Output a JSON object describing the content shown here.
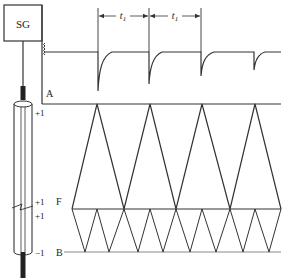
{
  "diagram": {
    "generator_label": "SG",
    "period_label": "t",
    "period_subscript": "1",
    "labels": {
      "A": "A",
      "F": "F",
      "B": "B",
      "plus_one_top": "+1",
      "plus_one_f_upper": "+1",
      "plus_one_f_lower": "+1",
      "minus_one_bottom": "−1"
    },
    "colors": {
      "line": "#333333",
      "background": "#ffffff",
      "cable": "#222222"
    },
    "levels": {
      "A_y": 104,
      "F_y": 209,
      "B_y": 252,
      "pulse_baseline_y": 52
    },
    "pulses": [
      {
        "x": 98,
        "depth_y": 92
      },
      {
        "x": 149,
        "depth_y": 84
      },
      {
        "x": 201,
        "depth_y": 76
      },
      {
        "x": 254,
        "depth_y": 70
      }
    ],
    "upper_zigzag": {
      "from_y": "F",
      "to_y": "A",
      "points_x": [
        72,
        97,
        124,
        150,
        176,
        202,
        230,
        255,
        281
      ]
    },
    "lower_zigzag": {
      "from_y": "F",
      "to_y": "B",
      "points_x": [
        72,
        85,
        97,
        109,
        124,
        138,
        150,
        163,
        176,
        190,
        202,
        216,
        230,
        243,
        255,
        269,
        281
      ]
    }
  }
}
